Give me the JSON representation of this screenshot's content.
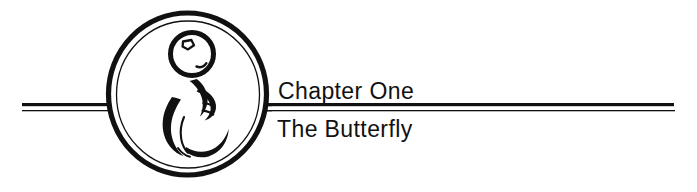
{
  "page": {
    "background_color": "#ffffff",
    "ink_color": "#111111",
    "width": 697,
    "height": 192
  },
  "heading": {
    "chapter_label": "Chapter One",
    "chapter_title": "The Butterfly"
  },
  "rules": {
    "thick_color": "#111111",
    "thin_color": "#111111",
    "thick_height": 3,
    "thin_height": 1
  },
  "illustration": {
    "name": "fetus-in-oval-emblem",
    "description": "Stylized line drawing of a curled fetus inside a double-ringed oval",
    "outer_ring_color": "#111111",
    "inner_ring_color": "#111111",
    "parts": {
      "outer_oval": "outer-oval-ring",
      "inner_oval": "inner-oval-ring",
      "head": "fetus-head-circle",
      "eye": "fetus-eye",
      "mouth": "fetus-mouth-arc",
      "body": "fetus-body-stroke",
      "limb": "fetus-limb-stroke",
      "torso": "fetus-torso-stroke"
    }
  }
}
